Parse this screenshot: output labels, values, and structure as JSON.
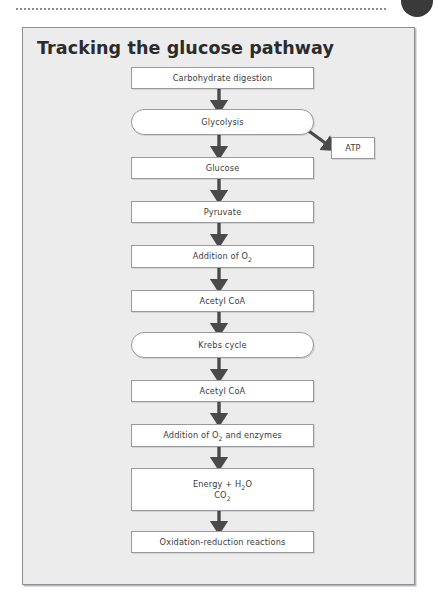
{
  "page": {
    "top_rule": "dotted-rule",
    "corner_marker": "page-marker-circle"
  },
  "panel": {
    "title": "Tracking the glucose pathway",
    "background_color": "#ececec",
    "border_color": "#8f8f93"
  },
  "flowchart": {
    "type": "flowchart",
    "orientation": "vertical",
    "node_fill": "#ffffff",
    "node_border": "#9a9a9e",
    "arrow_color": "#4a4a4a",
    "nodes": [
      {
        "id": "carbohydrate-digestion",
        "label": "Carbohydrate digestion",
        "shape": "rectangle"
      },
      {
        "id": "glycolysis",
        "label": "Glycolysis",
        "shape": "pill"
      },
      {
        "id": "atp",
        "label": "ATP",
        "shape": "rectangle"
      },
      {
        "id": "glucose",
        "label": "Glucose",
        "shape": "rectangle"
      },
      {
        "id": "pyruvate",
        "label": "Pyruvate",
        "shape": "rectangle"
      },
      {
        "id": "addition-of-o2",
        "label": "Addition of O2",
        "shape": "rectangle"
      },
      {
        "id": "acetyl-coa-1",
        "label": "Acetyl CoA",
        "shape": "rectangle"
      },
      {
        "id": "krebs-cycle",
        "label": "Krebs cycle",
        "shape": "pill"
      },
      {
        "id": "acetyl-coa-2",
        "label": "Acetyl CoA",
        "shape": "rectangle"
      },
      {
        "id": "addition-of-o2-and-enzymes",
        "label": "Addition of O2 and enzymes",
        "shape": "rectangle"
      },
      {
        "id": "energy-water-co2",
        "label": "Energy + H2O CO2",
        "shape": "rectangle"
      },
      {
        "id": "oxidation-reduction-reactions",
        "label": "Oxidation-reduction reactions",
        "shape": "rectangle"
      }
    ],
    "node_text": {
      "carbohydrate_digestion": "Carbohydrate digestion",
      "glycolysis": "Glycolysis",
      "atp": "ATP",
      "glucose": "Glucose",
      "pyruvate": "Pyruvate",
      "addition_of_o2_prefix": "Addition of O",
      "addition_of_o2_sub": "2",
      "acetyl_coa_1": "Acetyl CoA",
      "krebs_cycle": "Krebs cycle",
      "acetyl_coa_2": "Acetyl CoA",
      "addition_enzymes_prefix": "Addition of O",
      "addition_enzymes_sub": "2",
      "addition_enzymes_suffix": " and enzymes",
      "energy_line1_prefix": "Energy + H",
      "energy_line1_sub": "2",
      "energy_line1_suffix": "O",
      "energy_line2_prefix": "CO",
      "energy_line2_sub": "2",
      "oxidation_reduction": "Oxidation-reduction reactions"
    },
    "edges": [
      {
        "from": "carbohydrate-digestion",
        "to": "glycolysis",
        "style": "down-arrow"
      },
      {
        "from": "glycolysis",
        "to": "atp",
        "style": "diagonal-arrow"
      },
      {
        "from": "glycolysis",
        "to": "glucose",
        "style": "down-arrow"
      },
      {
        "from": "glucose",
        "to": "pyruvate",
        "style": "down-arrow"
      },
      {
        "from": "pyruvate",
        "to": "addition-of-o2",
        "style": "down-arrow"
      },
      {
        "from": "addition-of-o2",
        "to": "acetyl-coa-1",
        "style": "down-arrow"
      },
      {
        "from": "acetyl-coa-1",
        "to": "krebs-cycle",
        "style": "down-arrow"
      },
      {
        "from": "krebs-cycle",
        "to": "acetyl-coa-2",
        "style": "down-arrow"
      },
      {
        "from": "acetyl-coa-2",
        "to": "addition-of-o2-and-enzymes",
        "style": "down-arrow"
      },
      {
        "from": "addition-of-o2-and-enzymes",
        "to": "energy-water-co2",
        "style": "down-arrow"
      },
      {
        "from": "energy-water-co2",
        "to": "oxidation-reduction-reactions",
        "style": "down-arrow"
      }
    ]
  }
}
